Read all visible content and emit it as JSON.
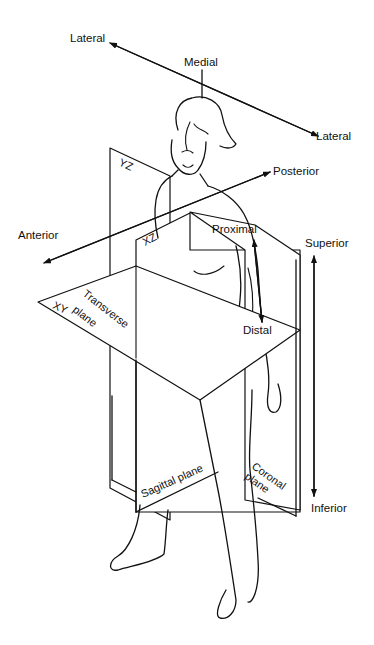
{
  "diagram": {
    "direction_labels": {
      "lateral_left": "Lateral",
      "lateral_right": "Lateral",
      "medial": "Medial",
      "anterior": "Anterior",
      "posterior": "Posterior",
      "proximal": "Proximal",
      "distal": "Distal",
      "superior": "Superior",
      "inferior": "Inferior"
    },
    "planes": [
      {
        "id": "yz",
        "axis_label": "YZ",
        "name": "Sagittal plane"
      },
      {
        "id": "xz",
        "axis_label": "XZ",
        "name": "Coronal plane"
      },
      {
        "id": "xy",
        "axis_label": "XY",
        "name_line1": "Transverse",
        "name_line2": "plane"
      }
    ],
    "plane_names": {
      "sagittal": "Sagittal plane",
      "coronal_line1": "Coronal",
      "coronal_line2": "plane",
      "transverse_line1": "Transverse",
      "transverse_line2": "plane"
    },
    "colors": {
      "line": "#111111",
      "background": "#ffffff"
    }
  }
}
